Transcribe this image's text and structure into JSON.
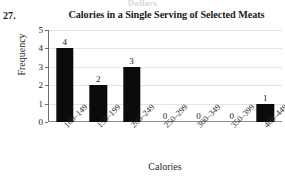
{
  "page": {
    "bleed_text": "Dollars",
    "question_number": "27."
  },
  "colors": {
    "bar": "#0b0b0b",
    "gridline": "#e4e4e4",
    "axis": "#6e6e6e",
    "text": "#1a1a1a"
  },
  "chart_data": {
    "type": "bar",
    "title": "Calories in a Single Serving of Selected Meats",
    "xlabel": "Calories",
    "ylabel": "Frequency",
    "categories": [
      "100–149",
      "150–199",
      "200–249",
      "250–299",
      "300–349",
      "350–399",
      "400–449"
    ],
    "values": [
      4,
      2,
      3,
      0,
      0,
      0,
      1
    ],
    "data_labels": [
      "4",
      "2",
      "3",
      "0",
      "0",
      "0",
      "1"
    ],
    "ylim": [
      0,
      5
    ],
    "yticks": [
      0,
      1,
      2,
      3,
      4,
      5
    ],
    "ytick_labels": [
      "0",
      "1",
      "2",
      "3",
      "4",
      "5"
    ],
    "grid": "horizontal",
    "legend": "none"
  }
}
